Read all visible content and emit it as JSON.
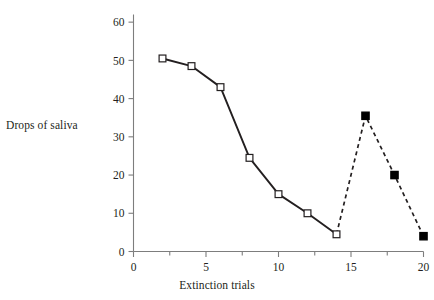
{
  "chart_data": {
    "type": "line",
    "title": "",
    "xlabel": "Extinction trials",
    "ylabel": "Drops of saliva",
    "xlim": [
      0,
      20
    ],
    "ylim": [
      0,
      62
    ],
    "grid": false,
    "legend": "none",
    "x_ticks": [
      0,
      5,
      10,
      15,
      20
    ],
    "x_tick_labels": [
      "0",
      "5",
      "10",
      "15",
      "20"
    ],
    "x_minor_ticks": [
      2.5,
      7.5,
      12.5,
      17.5
    ],
    "y_ticks": [
      0,
      10,
      20,
      30,
      40,
      50,
      60
    ],
    "y_tick_labels": [
      "0",
      "10",
      "20",
      "30",
      "40",
      "50",
      "60"
    ],
    "series": [
      {
        "name": "extinction",
        "line_style": "solid",
        "marker": "open-square",
        "marker_fill": "#ffffff",
        "marker_edge": "#231f20",
        "color": "#231f20",
        "x": [
          2,
          4,
          6,
          8,
          10,
          12,
          14
        ],
        "values": [
          50.5,
          48.5,
          43,
          24.5,
          15,
          10,
          4.5
        ]
      },
      {
        "name": "spontaneous-recovery",
        "line_style": "dashed",
        "marker": "filled-square",
        "marker_fill": "#000000",
        "marker_edge": "#000000",
        "color": "#231f20",
        "x": [
          14,
          16,
          18,
          20
        ],
        "values": [
          4.5,
          35.5,
          20,
          4
        ]
      }
    ]
  },
  "axes": {
    "y_title": "Drops of saliva",
    "x_title": "Extinction trials"
  },
  "colors": {
    "axis": "#7d7d7d",
    "ink": "#231f20",
    "marker_fill": "#000000",
    "background": "#ffffff"
  }
}
